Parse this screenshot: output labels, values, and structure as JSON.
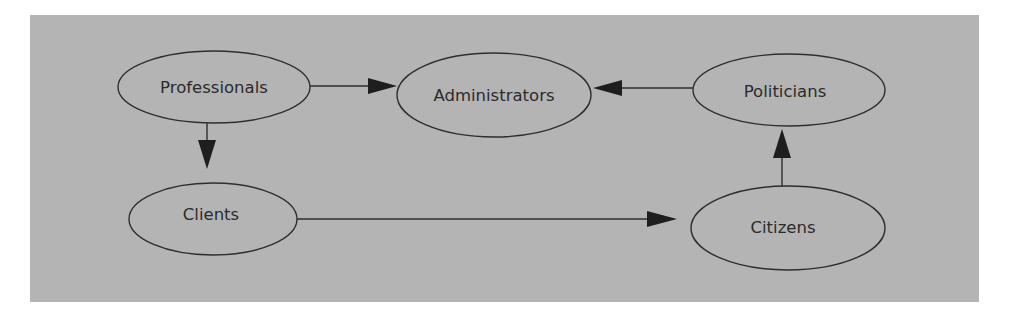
{
  "diagram": {
    "type": "directed-graph",
    "background_color": "#b4b4b4",
    "stroke_color": "#2e2e2e",
    "text_color": "#2b2b2b",
    "nodes": [
      {
        "id": "professionals",
        "label": "Professionals",
        "shape": "ellipse"
      },
      {
        "id": "administrators",
        "label": "Administrators",
        "shape": "ellipse"
      },
      {
        "id": "politicians",
        "label": "Politicians",
        "shape": "ellipse"
      },
      {
        "id": "clients",
        "label": "Clients",
        "shape": "ellipse"
      },
      {
        "id": "citizens",
        "label": "Citizens",
        "shape": "ellipse"
      }
    ],
    "edges": [
      {
        "from": "professionals",
        "to": "administrators"
      },
      {
        "from": "politicians",
        "to": "administrators"
      },
      {
        "from": "professionals",
        "to": "clients"
      },
      {
        "from": "clients",
        "to": "citizens"
      },
      {
        "from": "citizens",
        "to": "politicians"
      }
    ]
  }
}
